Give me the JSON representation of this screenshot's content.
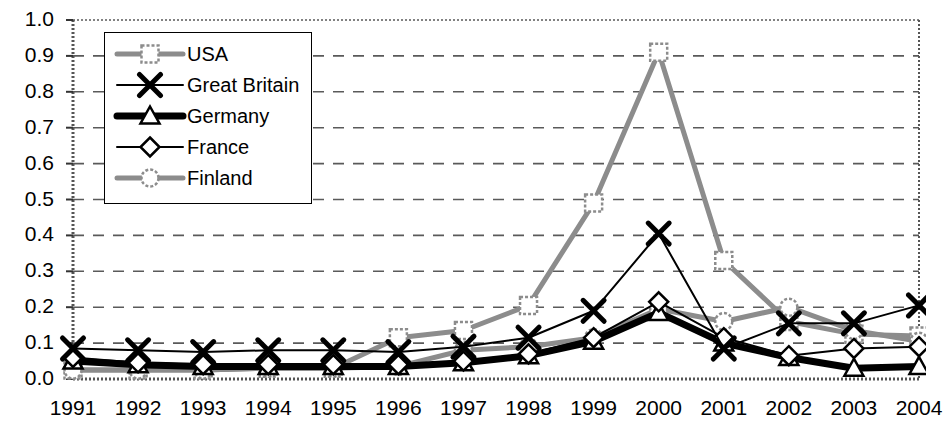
{
  "chart_data": {
    "type": "line",
    "title": "",
    "subtitle": "",
    "xlabel": "",
    "ylabel": "",
    "grid": true,
    "grid_style": "dashed-horizontal",
    "legend_position": "top-left-inside",
    "xlim": [
      1991,
      2004
    ],
    "ylim": [
      0.0,
      1.0
    ],
    "ytick_labels": [
      "1.0",
      "0.9",
      "0.8",
      "0.7",
      "0.6",
      "0.5",
      "0.4",
      "0.3",
      "0.2",
      "0.1",
      "0.0"
    ],
    "ytick_values": [
      1.0,
      0.9,
      0.8,
      0.7,
      0.6,
      0.5,
      0.4,
      0.3,
      0.2,
      0.1,
      0.0
    ],
    "categories": [
      "1991",
      "1992",
      "1993",
      "1994",
      "1995",
      "1996",
      "1997",
      "1998",
      "1999",
      "2000",
      "2001",
      "2002",
      "2003",
      "2004"
    ],
    "x": [
      1991,
      1992,
      1993,
      1994,
      1995,
      1996,
      1997,
      1998,
      1999,
      2000,
      2001,
      2002,
      2003,
      2004
    ],
    "series": [
      {
        "name": "USA",
        "marker": "open-square",
        "color": "#8c8c8c",
        "line_width": 5,
        "values": [
          0.025,
          0.025,
          0.025,
          0.03,
          0.03,
          0.115,
          0.135,
          0.205,
          0.49,
          0.91,
          0.33,
          0.16,
          0.125,
          0.12
        ]
      },
      {
        "name": "Great Britain",
        "marker": "x-cross",
        "color": "#000000",
        "line_width": 2,
        "values": [
          0.085,
          0.08,
          0.075,
          0.08,
          0.08,
          0.075,
          0.09,
          0.115,
          0.19,
          0.405,
          0.085,
          0.155,
          0.155,
          0.205
        ]
      },
      {
        "name": "Germany",
        "marker": "open-triangle",
        "color": "#000000",
        "line_width": 7,
        "values": [
          0.05,
          0.04,
          0.035,
          0.035,
          0.035,
          0.035,
          0.045,
          0.065,
          0.105,
          0.185,
          0.1,
          0.06,
          0.03,
          0.035
        ]
      },
      {
        "name": "France",
        "marker": "open-diamond",
        "color": "#000000",
        "line_width": 2,
        "values": [
          0.06,
          0.045,
          0.04,
          0.04,
          0.04,
          0.04,
          0.05,
          0.07,
          0.115,
          0.215,
          0.115,
          0.065,
          0.085,
          0.09
        ]
      },
      {
        "name": "Finland",
        "marker": "open-circle",
        "color": "#8c8c8c",
        "line_width": 5,
        "values": [
          0.025,
          0.025,
          0.025,
          0.03,
          0.03,
          0.035,
          0.08,
          0.09,
          0.115,
          0.195,
          0.16,
          0.2,
          0.135,
          0.105
        ]
      }
    ]
  },
  "legend": {
    "entries": [
      {
        "label": "USA"
      },
      {
        "label": "Great Britain"
      },
      {
        "label": "Germany"
      },
      {
        "label": "France"
      },
      {
        "label": "Finland"
      }
    ]
  }
}
